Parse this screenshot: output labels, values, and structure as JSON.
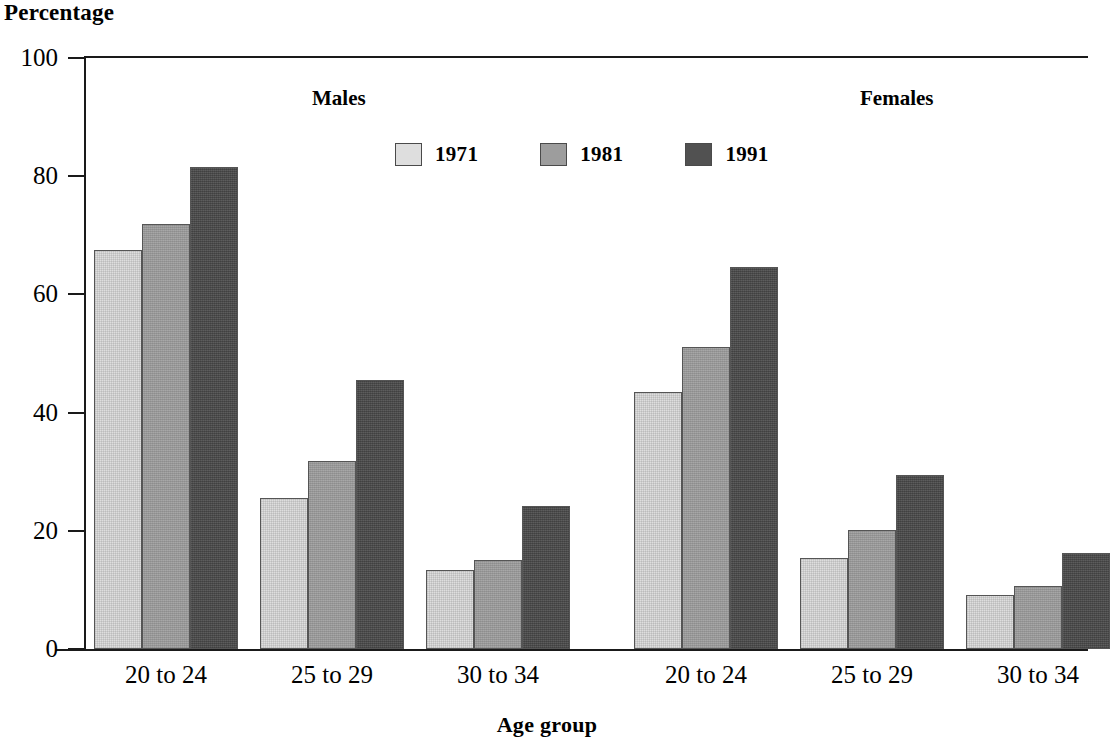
{
  "chart_data": {
    "type": "bar",
    "title": "",
    "ylabel": "Percentage",
    "xlabel": "Age group",
    "ylim": [
      0,
      100
    ],
    "yticks": [
      0,
      20,
      40,
      60,
      80,
      100
    ],
    "grid": false,
    "legend_position": "top-center",
    "panels": [
      {
        "name": "Males",
        "categories": [
          "20 to 24",
          "25 to 29",
          "30 to 34"
        ],
        "series": [
          {
            "name": "1971",
            "values": [
              67.5,
              25.5,
              13.4
            ]
          },
          {
            "name": "1981",
            "values": [
              71.9,
              31.8,
              15.0
            ]
          },
          {
            "name": "1991",
            "values": [
              81.5,
              45.6,
              24.2
            ]
          }
        ]
      },
      {
        "name": "Females",
        "categories": [
          "20 to 24",
          "25 to 29",
          "30 to 34"
        ],
        "series": [
          {
            "name": "1971",
            "values": [
              43.5,
              15.4,
              9.2
            ]
          },
          {
            "name": "1981",
            "values": [
              51.1,
              20.2,
              10.7
            ]
          },
          {
            "name": "1991",
            "values": [
              64.7,
              29.5,
              16.3
            ]
          }
        ]
      }
    ],
    "series_colors": {
      "1971": "#dedede",
      "1981": "#9d9d9d",
      "1991": "#515151"
    }
  },
  "axis": {
    "y_title": "Percentage",
    "x_title": "Age group",
    "y_ticks": [
      "100",
      "80",
      "60",
      "40",
      "20",
      "0"
    ]
  },
  "panel_headings": {
    "males": "Males",
    "females": "Females"
  },
  "legend": {
    "items": [
      {
        "label": "1971",
        "color": "#dedede"
      },
      {
        "label": "1981",
        "color": "#9d9d9d"
      },
      {
        "label": "1991",
        "color": "#515151"
      }
    ]
  },
  "x_tick_labels": {
    "males": [
      "20 to 24",
      "25 to 29",
      "30 to 34"
    ],
    "females": [
      "20 to 24",
      "25 to 29",
      "30 to 34"
    ]
  }
}
